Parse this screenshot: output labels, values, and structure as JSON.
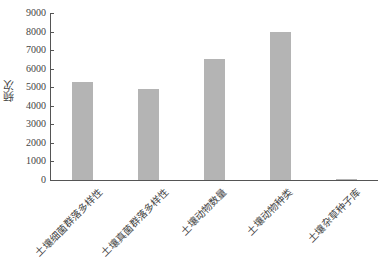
{
  "chart_data": {
    "type": "bar",
    "title": "",
    "xlabel": "",
    "ylabel": "频次",
    "ylim": [
      0,
      9000
    ],
    "yticks": [
      0,
      1000,
      2000,
      3000,
      4000,
      5000,
      6000,
      7000,
      8000,
      9000
    ],
    "categories": [
      "土壤细菌群落多样性",
      "土壤真菌群落多样性",
      "土壤动物数量",
      "土壤动物种类",
      "土壤杂草种子库"
    ],
    "values": [
      5300,
      4900,
      6500,
      7950,
      20
    ],
    "grid": false,
    "legend": null,
    "bar_color": "#b4b4b4"
  },
  "axis": {
    "ylabel": "频次",
    "ytick_labels": [
      "0",
      "1000",
      "2000",
      "3000",
      "4000",
      "5000",
      "6000",
      "7000",
      "8000",
      "9000"
    ]
  }
}
